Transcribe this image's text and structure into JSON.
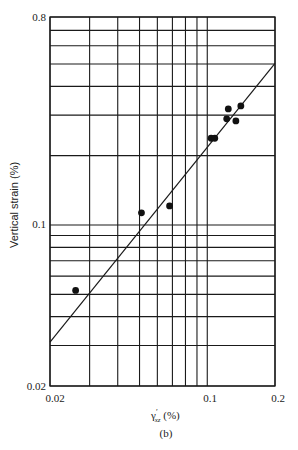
{
  "chart_data": {
    "type": "scatter",
    "title": "",
    "caption": "(b)",
    "xlabel": "γ'xz (%)",
    "ylabel": "Vertical strain (%)",
    "xscale": "log",
    "yscale": "log",
    "xlim": [
      0.02,
      0.2
    ],
    "ylim": [
      0.02,
      0.8
    ],
    "xticks": [
      0.02,
      0.1,
      0.2
    ],
    "xtick_labels": [
      "0.02",
      "0.1",
      "0.2"
    ],
    "yticks": [
      0.02,
      0.1,
      0.8
    ],
    "ytick_labels": [
      "0.02",
      "0.1",
      "0.8"
    ],
    "x_gridlines": [
      0.02,
      0.03,
      0.04,
      0.05,
      0.06,
      0.07,
      0.08,
      0.09,
      0.1,
      0.2
    ],
    "y_gridlines": [
      0.02,
      0.03,
      0.04,
      0.05,
      0.06,
      0.07,
      0.08,
      0.09,
      0.1,
      0.2,
      0.3,
      0.4,
      0.5,
      0.6,
      0.7,
      0.8
    ],
    "grid": true,
    "legend": null,
    "series": [
      {
        "name": "measured",
        "marker": "filled-circle",
        "points": [
          {
            "x": 0.026,
            "y": 0.052
          },
          {
            "x": 0.051,
            "y": 0.113
          },
          {
            "x": 0.068,
            "y": 0.121
          },
          {
            "x": 0.104,
            "y": 0.238
          },
          {
            "x": 0.108,
            "y": 0.238
          },
          {
            "x": 0.122,
            "y": 0.289
          },
          {
            "x": 0.124,
            "y": 0.319
          },
          {
            "x": 0.134,
            "y": 0.283
          },
          {
            "x": 0.141,
            "y": 0.329
          }
        ]
      },
      {
        "name": "fit-line",
        "type": "line",
        "points": [
          {
            "x": 0.02,
            "y": 0.031
          },
          {
            "x": 0.2,
            "y": 0.503
          }
        ]
      }
    ]
  },
  "labels": {
    "y_axis": "Vertical strain (%)",
    "x_axis_symbol": "γ",
    "x_axis_sup": "′",
    "x_axis_sub": "xz",
    "x_axis_unit": " (%)",
    "caption": "(b)",
    "xtick_002": "0.02",
    "xtick_01": "0.1",
    "xtick_02": "0.2",
    "ytick_08": "0.8",
    "ytick_01": "0.1",
    "ytick_002": "0.02"
  }
}
